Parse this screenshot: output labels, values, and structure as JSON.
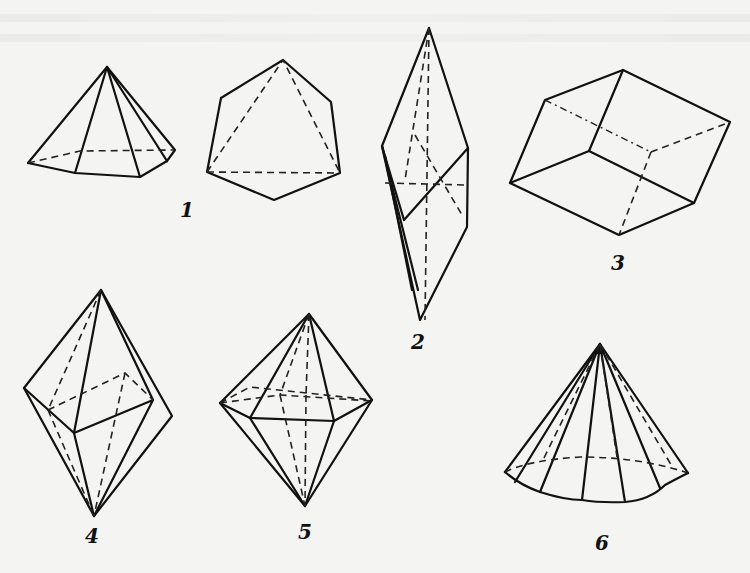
{
  "figure": {
    "background": "#f4f4f2",
    "line_color": "#111111",
    "items": [
      {
        "id": "1",
        "label": "1",
        "shapes": [
          "hexagonal pyramid",
          "octahedron-like hexagonal outline"
        ]
      },
      {
        "id": "2",
        "label": "2",
        "shapes": [
          "elongated bipyramid"
        ]
      },
      {
        "id": "3",
        "label": "3",
        "shapes": [
          "rhombohedron"
        ]
      },
      {
        "id": "4",
        "label": "4",
        "shapes": [
          "tetragonal bipyramid"
        ]
      },
      {
        "id": "5",
        "label": "5",
        "shapes": [
          "hexagonal bipyramid"
        ]
      },
      {
        "id": "6",
        "label": "6",
        "shapes": [
          "polygonal pyramid (cone-like)"
        ]
      }
    ]
  }
}
